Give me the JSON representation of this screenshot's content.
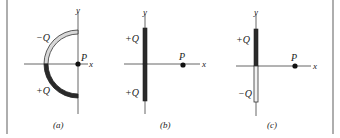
{
  "figure": {
    "panels": [
      {
        "id": "a",
        "caption": "(a)",
        "description": "Semicircular arc in left half-plane centered on P; upper quarter charged -Q, lower quarter charged +Q",
        "axis_labels": {
          "x": "x",
          "y": "y"
        },
        "point_label": "P",
        "charges": [
          {
            "label": "−Q",
            "position": "upper quarter arc",
            "fill": "#d8d8d8"
          },
          {
            "label": "+Q",
            "position": "lower quarter arc",
            "fill": "#2a2a2a"
          }
        ]
      },
      {
        "id": "b",
        "caption": "(b)",
        "description": "Vertical rod on y-axis; upper half +Q, lower half +Q; P on x-axis",
        "axis_labels": {
          "x": "x",
          "y": "y"
        },
        "point_label": "P",
        "charges": [
          {
            "label": "+Q",
            "position": "upper half rod",
            "fill": "#2a2a2a"
          },
          {
            "label": "+Q",
            "position": "lower half rod",
            "fill": "#2a2a2a"
          }
        ]
      },
      {
        "id": "c",
        "caption": "(c)",
        "description": "Vertical rod on y-axis; upper half +Q, lower half -Q; P on x-axis",
        "axis_labels": {
          "x": "x",
          "y": "y"
        },
        "point_label": "P",
        "charges": [
          {
            "label": "+Q",
            "position": "upper half rod",
            "fill": "#2a2a2a"
          },
          {
            "label": "−Q",
            "position": "lower half rod",
            "fill": "#f2f2f2"
          }
        ]
      }
    ],
    "colors": {
      "positive_charge": "#2a2a2a",
      "negative_charge_a": "#d8d8d8",
      "negative_charge_c": "#f2f2f2",
      "axis": "#555555",
      "border": "#9a9a9a"
    }
  }
}
